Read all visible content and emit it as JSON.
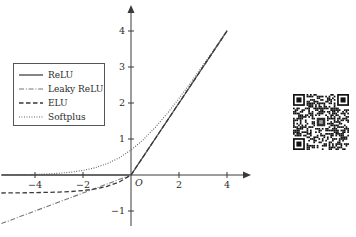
{
  "chart_data": {
    "type": "line",
    "title": "",
    "xlabel": "",
    "ylabel": "",
    "xlim": [
      -5.4,
      5.2
    ],
    "ylim": [
      -1.55,
      4.6
    ],
    "xticks": [
      -4,
      -2,
      2,
      4
    ],
    "yticks": [
      -1,
      1,
      2,
      3,
      4
    ],
    "xtick_labels": [
      "-4",
      "-2",
      "2",
      "4"
    ],
    "ytick_labels": [
      "-1",
      "1",
      "2",
      "3",
      "4"
    ],
    "origin_label": "O",
    "grid": false,
    "legend_position": "upper-left",
    "axis_arrows": true,
    "series": [
      {
        "name": "ReLU",
        "style": "solid",
        "color": "#333333",
        "x": [
          -5.4,
          -4,
          -3,
          -2,
          -1,
          0,
          0.5,
          1,
          1.5,
          2,
          2.5,
          3,
          3.5,
          4
        ],
        "values": [
          0,
          0,
          0,
          0,
          0,
          0,
          0.5,
          1,
          1.5,
          2,
          2.5,
          3,
          3.5,
          4
        ]
      },
      {
        "name": "Leaky ReLU",
        "style": "dashdot",
        "color": "#777777",
        "x": [
          -5.4,
          -4,
          -3,
          -2,
          -1,
          0,
          1,
          2,
          3,
          4
        ],
        "values": [
          -1.35,
          -1.0,
          -0.75,
          -0.5,
          -0.25,
          0,
          1,
          2,
          3,
          4
        ]
      },
      {
        "name": "ELU",
        "style": "dashed",
        "color": "#3a3a3a",
        "x": [
          -5.4,
          -4,
          -3,
          -2.5,
          -2,
          -1.5,
          -1,
          -0.5,
          0,
          1,
          2,
          3,
          4
        ],
        "values": [
          -0.5,
          -0.49,
          -0.475,
          -0.459,
          -0.432,
          -0.388,
          -0.316,
          -0.197,
          0,
          1,
          2,
          3,
          4
        ]
      },
      {
        "name": "Softplus",
        "style": "dotted",
        "color": "#555555",
        "x": [
          -5.4,
          -4.5,
          -4,
          -3.5,
          -3,
          -2.5,
          -2,
          -1.5,
          -1,
          -0.5,
          0,
          0.5,
          1,
          1.5,
          2,
          2.5,
          3,
          3.5,
          4
        ],
        "values": [
          0.0045,
          0.0111,
          0.0181,
          0.0295,
          0.0486,
          0.0789,
          0.1269,
          0.2014,
          0.3133,
          0.4741,
          0.6931,
          0.9741,
          1.3133,
          1.7014,
          2.1269,
          2.5789,
          3.0486,
          3.5295,
          4.0181
        ]
      }
    ]
  },
  "legend": {
    "items": [
      {
        "label": "ReLU",
        "style": "solid"
      },
      {
        "label": "Leaky ReLU",
        "style": "dashdot"
      },
      {
        "label": "ELU",
        "style": "dashed"
      },
      {
        "label": "Softplus",
        "style": "dotted"
      }
    ]
  },
  "qr_code": {
    "alt": "qr-code"
  },
  "caption": {
    "text": ""
  }
}
